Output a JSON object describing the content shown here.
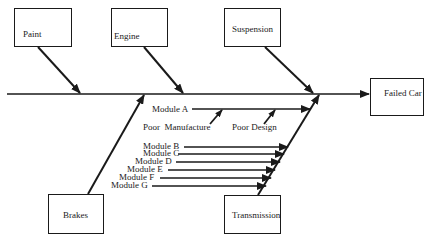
{
  "diagram": {
    "type": "fishbone",
    "effect": {
      "label": "Failed Car"
    },
    "categories": [
      {
        "id": "paint",
        "label": "Paint",
        "position": "top"
      },
      {
        "id": "engine",
        "label": "Engine",
        "position": "top"
      },
      {
        "id": "suspension",
        "label": "Suspension",
        "position": "top"
      },
      {
        "id": "brakes",
        "label": "Brakes",
        "position": "bottom"
      },
      {
        "id": "transmission",
        "label": "Transmission",
        "position": "bottom"
      }
    ],
    "transmission_causes": {
      "module_a": {
        "label": "Module A",
        "sub_causes": [
          "Poor  Manufacture",
          "Poor Design"
        ]
      },
      "modules": [
        "Module B",
        "Module C",
        "Module D",
        "Module E",
        "Module F",
        "Module G"
      ]
    },
    "colors": {
      "line": "#1a1a1a",
      "background": "#ffffff"
    }
  }
}
